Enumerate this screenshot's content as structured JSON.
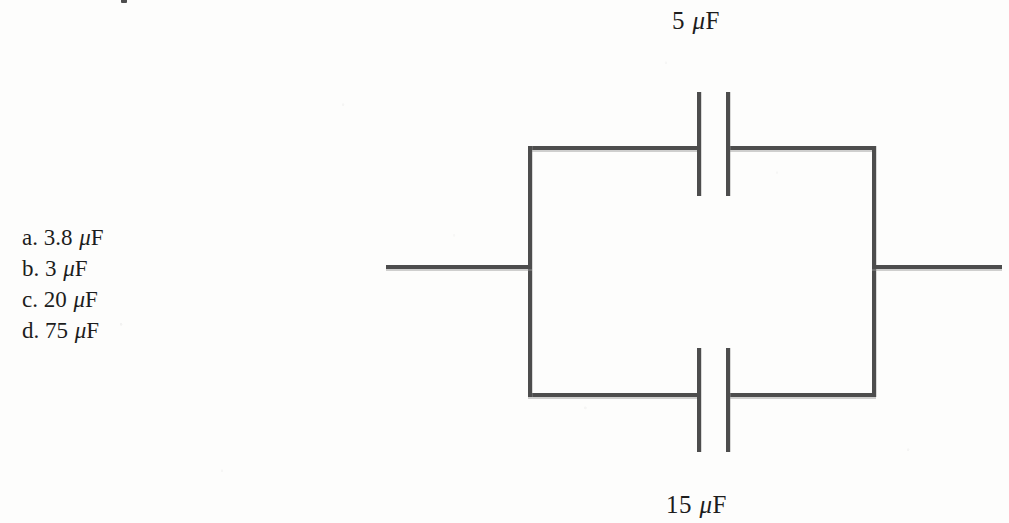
{
  "question": {
    "options": [
      {
        "letter": "a.",
        "value": "3.8",
        "mu": "μ",
        "unit": "F",
        "text": "a. 3.8 μF"
      },
      {
        "letter": "b.",
        "value": "3",
        "mu": "μ",
        "unit": "F",
        "text": "b. 3 μF"
      },
      {
        "letter": "c.",
        "value": "20",
        "mu": "μ",
        "unit": "F",
        "text": "c. 20 μF"
      },
      {
        "letter": "d.",
        "value": "75",
        "mu": "μ",
        "unit": "F",
        "text": "d. 75 μF"
      }
    ]
  },
  "circuit": {
    "type": "parallel-capacitor-network",
    "top_capacitor_label": "5 μF",
    "bottom_capacitor_label": "15 μF",
    "line_color": "#4d4d4d",
    "background_color": "#fdfdfc",
    "components": [
      {
        "name": "capacitor-top",
        "capacitance": "5 μF"
      },
      {
        "name": "capacitor-bottom",
        "capacitance": "15 μF"
      }
    ]
  }
}
